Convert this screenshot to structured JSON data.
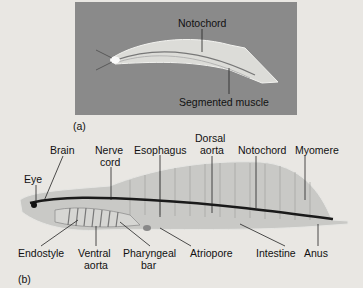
{
  "figure": {
    "panel_a": {
      "tag": "(a)",
      "labels": {
        "notochord": "Notochord",
        "segmented_muscle": "Segmented muscle"
      }
    },
    "panel_b": {
      "tag": "(b)",
      "labels": {
        "eye": "Eye",
        "brain": "Brain",
        "nerve_cord_1": "Nerve",
        "nerve_cord_2": "cord",
        "esophagus": "Esophagus",
        "dorsal_aorta_1": "Dorsal",
        "dorsal_aorta_2": "aorta",
        "notochord": "Notochord",
        "myomere": "Myomere",
        "endostyle": "Endostyle",
        "ventral_aorta_1": "Ventral",
        "ventral_aorta_2": "aorta",
        "pharyngeal_bar_1": "Pharyngeal",
        "pharyngeal_bar_2": "bar",
        "atriopore": "Atriopore",
        "intestine": "Intestine",
        "anus": "Anus"
      }
    },
    "colors": {
      "background": "#e9e7e3",
      "panel_a_bg": "#8a8a8a",
      "body_fill": "#c9c9c6",
      "nerve_cord": "#1a1a1a"
    }
  }
}
